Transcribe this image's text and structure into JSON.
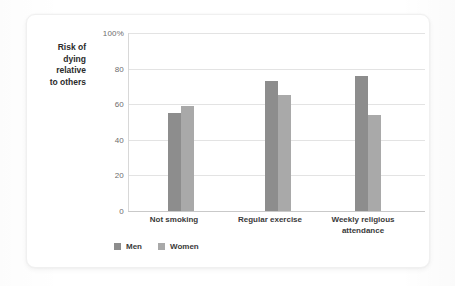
{
  "chart_data": {
    "type": "bar",
    "title": "",
    "subtitle": "",
    "xlabel": "",
    "ylabel": "Risk of dying relative to others",
    "ylabel_lines": [
      "Risk of",
      "dying",
      "relative",
      "to others"
    ],
    "categories": [
      "Not smoking",
      "Regular exercise",
      "Weekly religious attendance"
    ],
    "category_lines": [
      [
        "Not smoking"
      ],
      [
        "Regular exercise"
      ],
      [
        "Weekly religious",
        "attendance"
      ]
    ],
    "series": [
      {
        "name": "Men",
        "color": "#8d8d8d",
        "values": [
          55,
          73,
          76
        ]
      },
      {
        "name": "Women",
        "color": "#a9a9a9",
        "values": [
          59,
          65,
          54
        ]
      }
    ],
    "ylim": [
      0,
      100
    ],
    "ytick_values": [
      0,
      20,
      40,
      60,
      80,
      100
    ],
    "ytick_labels": [
      "0",
      "20",
      "40",
      "60",
      "80",
      "100%"
    ],
    "grid": true,
    "grid_color": "#e3e3e3",
    "legend_position": "bottom-left",
    "legend_entries": [
      "Men",
      "Women"
    ],
    "background": "#ffffff"
  }
}
